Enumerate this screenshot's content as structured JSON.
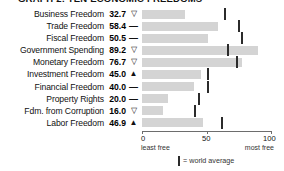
{
  "title": "GRAPH 2: TEN ECONOMIC FREEDOMS",
  "legend": {
    "tick_icon": "vertical-tick-icon",
    "text": "= world average"
  },
  "axis": {
    "ticks": [
      "0",
      "50",
      "100"
    ],
    "tick_values": [
      0,
      50,
      100
    ],
    "low_label": "least free",
    "high_label": "most free"
  },
  "markers": {
    "down": "▽",
    "flat": "—",
    "up": "▲"
  },
  "colors": {
    "bar": "#d4d4d4",
    "tick": "#2b2b2b",
    "axis": "#6d6d6d",
    "text": "#111111"
  },
  "chart_data": {
    "type": "bar",
    "title": "GRAPH 2: TEN ECONOMIC FREEDOMS",
    "xlabel": "",
    "ylabel": "",
    "xlim": [
      0,
      100
    ],
    "grid": false,
    "legend_position": "bottom",
    "categories": [
      "Business Freedom",
      "Trade Freedom",
      "Fiscal Freedom",
      "Government Spending",
      "Monetary Freedom",
      "Investment Freedom",
      "Financial Freedom",
      "Property Rights",
      "Fdm. from Corruption",
      "Labor Freedom"
    ],
    "values": [
      32.7,
      58.4,
      50.5,
      89.2,
      76.7,
      45.0,
      40.0,
      20.0,
      16.0,
      46.9
    ],
    "value_labels": [
      "32.7",
      "58.4",
      "50.5",
      "89.2",
      "76.7",
      "45.0",
      "40.0",
      "20.0",
      "16.0",
      "46.9"
    ],
    "trend_markers": [
      "down",
      "flat",
      "flat",
      "down",
      "down",
      "up",
      "flat",
      "flat",
      "down",
      "up"
    ],
    "world_average": [
      63,
      74,
      76,
      65,
      72,
      50,
      50,
      43,
      40,
      61
    ],
    "series": [
      {
        "name": "Country score",
        "values": [
          32.7,
          58.4,
          50.5,
          89.2,
          76.7,
          45.0,
          40.0,
          20.0,
          16.0,
          46.9
        ]
      },
      {
        "name": "World average",
        "values": [
          63,
          74,
          76,
          65,
          72,
          50,
          50,
          43,
          40,
          61
        ]
      }
    ]
  },
  "rows": [
    {
      "label": "Business Freedom",
      "value": "32.7",
      "marker": "▽",
      "marker_name": "trend-down-icon",
      "bar_pct": 32.7,
      "avg_pct": 63
    },
    {
      "label": "Trade Freedom",
      "value": "58.4",
      "marker": "—",
      "marker_name": "trend-flat-icon",
      "bar_pct": 58.4,
      "avg_pct": 74
    },
    {
      "label": "Fiscal Freedom",
      "value": "50.5",
      "marker": "—",
      "marker_name": "trend-flat-icon",
      "bar_pct": 50.5,
      "avg_pct": 76
    },
    {
      "label": "Government Spending",
      "value": "89.2",
      "marker": "▽",
      "marker_name": "trend-down-icon",
      "bar_pct": 89.2,
      "avg_pct": 65
    },
    {
      "label": "Monetary Freedom",
      "value": "76.7",
      "marker": "▽",
      "marker_name": "trend-down-icon",
      "bar_pct": 76.7,
      "avg_pct": 72
    },
    {
      "label": "Investment Freedom",
      "value": "45.0",
      "marker": "▲",
      "marker_name": "trend-up-icon",
      "bar_pct": 45.0,
      "avg_pct": 50
    },
    {
      "label": "Financial Freedom",
      "value": "40.0",
      "marker": "—",
      "marker_name": "trend-flat-icon",
      "bar_pct": 40.0,
      "avg_pct": 50
    },
    {
      "label": "Property Rights",
      "value": "20.0",
      "marker": "—",
      "marker_name": "trend-flat-icon",
      "bar_pct": 20.0,
      "avg_pct": 43
    },
    {
      "label": "Fdm. from Corruption",
      "value": "16.0",
      "marker": "▽",
      "marker_name": "trend-down-icon",
      "bar_pct": 16.0,
      "avg_pct": 40
    },
    {
      "label": "Labor Freedom",
      "value": "46.9",
      "marker": "▲",
      "marker_name": "trend-up-icon",
      "bar_pct": 46.9,
      "avg_pct": 61
    }
  ]
}
